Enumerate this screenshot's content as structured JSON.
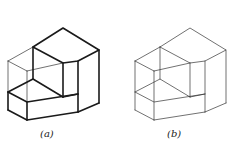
{
  "figures": [
    {
      "id": "a",
      "caption": "(a)",
      "caption_x": 40,
      "offset_x": 0,
      "style": "bold outline with thin hidden/inner edges"
    },
    {
      "id": "b",
      "caption": "(b)",
      "caption_x": 167,
      "offset_x": 127,
      "style": "uniform thin edges"
    }
  ],
  "colors": {
    "line": "#1a1a1a",
    "background": "#ffffff"
  }
}
